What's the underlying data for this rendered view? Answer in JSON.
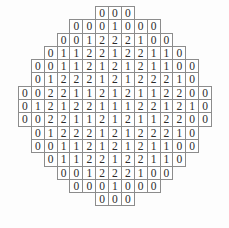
{
  "figure": {
    "type": "value-grid",
    "shape": "octagon-diamond",
    "total_rows": 15,
    "max_row_width": 15,
    "distinct_values": [
      "0",
      "1",
      "2"
    ],
    "colors": {
      "background": "#fdfdfd",
      "cell_background": "#ffffff",
      "cell_border": "#8c8c8c",
      "text": "#2b2b2b"
    }
  },
  "chart_data": {
    "type": "table",
    "title": "",
    "xlabel": "",
    "ylabel": "",
    "rows": [
      {
        "index": 0,
        "count": 3,
        "values": [
          "0",
          "0",
          "0"
        ]
      },
      {
        "index": 1,
        "count": 7,
        "values": [
          "0",
          "0",
          "0",
          "1",
          "0",
          "0",
          "0"
        ]
      },
      {
        "index": 2,
        "count": 9,
        "values": [
          "0",
          "0",
          "1",
          "2",
          "2",
          "2",
          "1",
          "0",
          "0"
        ]
      },
      {
        "index": 3,
        "count": 11,
        "values": [
          "0",
          "1",
          "1",
          "2",
          "2",
          "1",
          "2",
          "2",
          "1",
          "1",
          "0"
        ]
      },
      {
        "index": 4,
        "count": 13,
        "values": [
          "0",
          "0",
          "1",
          "1",
          "2",
          "1",
          "2",
          "1",
          "2",
          "1",
          "1",
          "0",
          "0"
        ]
      },
      {
        "index": 5,
        "count": 13,
        "values": [
          "0",
          "1",
          "2",
          "2",
          "2",
          "1",
          "2",
          "1",
          "2",
          "2",
          "2",
          "1",
          "0"
        ]
      },
      {
        "index": 6,
        "count": 15,
        "values": [
          "0",
          "0",
          "2",
          "2",
          "1",
          "1",
          "2",
          "1",
          "2",
          "1",
          "1",
          "2",
          "2",
          "0",
          "0"
        ]
      },
      {
        "index": 7,
        "count": 15,
        "values": [
          "0",
          "1",
          "2",
          "1",
          "2",
          "2",
          "1",
          "1",
          "1",
          "2",
          "2",
          "1",
          "2",
          "1",
          "0"
        ]
      },
      {
        "index": 8,
        "count": 15,
        "values": [
          "0",
          "0",
          "2",
          "2",
          "1",
          "1",
          "2",
          "1",
          "2",
          "1",
          "1",
          "2",
          "2",
          "0",
          "0"
        ]
      },
      {
        "index": 9,
        "count": 13,
        "values": [
          "0",
          "1",
          "2",
          "2",
          "2",
          "1",
          "2",
          "1",
          "2",
          "2",
          "2",
          "1",
          "0"
        ]
      },
      {
        "index": 10,
        "count": 13,
        "values": [
          "0",
          "0",
          "1",
          "1",
          "2",
          "1",
          "2",
          "1",
          "2",
          "1",
          "1",
          "0",
          "0"
        ]
      },
      {
        "index": 11,
        "count": 11,
        "values": [
          "0",
          "1",
          "1",
          "2",
          "2",
          "1",
          "2",
          "2",
          "1",
          "1",
          "0"
        ]
      },
      {
        "index": 12,
        "count": 9,
        "values": [
          "0",
          "0",
          "1",
          "2",
          "2",
          "2",
          "1",
          "0",
          "0"
        ]
      },
      {
        "index": 13,
        "count": 7,
        "values": [
          "0",
          "0",
          "0",
          "1",
          "0",
          "0",
          "0"
        ]
      },
      {
        "index": 14,
        "count": 3,
        "values": [
          "0",
          "0",
          "0"
        ]
      }
    ]
  }
}
